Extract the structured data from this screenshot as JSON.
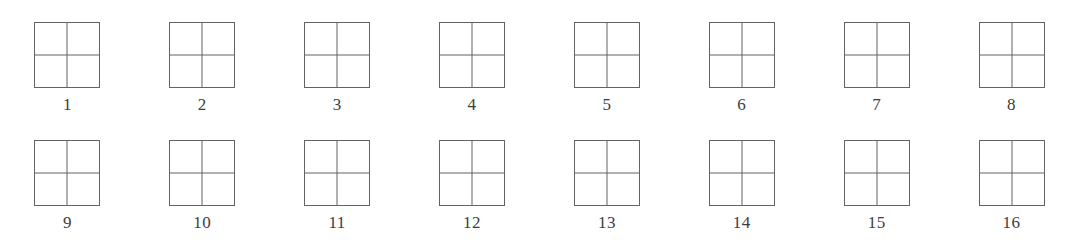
{
  "figure": {
    "background_color": "#ffffff",
    "line_color": "#636363",
    "label_color": "#3d3d3d",
    "rows": 2,
    "columns": 8,
    "total_items": 16,
    "shape_name": "two-by-two-grid-square",
    "items": [
      {
        "label": "1"
      },
      {
        "label": "2"
      },
      {
        "label": "3"
      },
      {
        "label": "4"
      },
      {
        "label": "5"
      },
      {
        "label": "6"
      },
      {
        "label": "7"
      },
      {
        "label": "8"
      },
      {
        "label": "9"
      },
      {
        "label": "10"
      },
      {
        "label": "11"
      },
      {
        "label": "12"
      },
      {
        "label": "13"
      },
      {
        "label": "14"
      },
      {
        "label": "15"
      },
      {
        "label": "16"
      }
    ]
  }
}
